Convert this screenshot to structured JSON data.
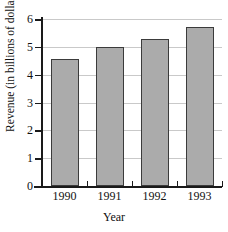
{
  "chart_data": {
    "type": "bar",
    "title": "",
    "categories": [
      "1990",
      "1991",
      "1992",
      "1993"
    ],
    "values": [
      4.55,
      5.0,
      5.27,
      5.72
    ],
    "xlabel": "Year",
    "ylabel": "Revenue (in billions of dollars)",
    "ylim": [
      0,
      6
    ],
    "ytick_labels": [
      "0",
      "1",
      "2",
      "3",
      "4",
      "5",
      "6"
    ],
    "ytick_values": [
      0,
      1,
      2,
      3,
      4,
      5,
      6
    ],
    "grid": true,
    "legend": false,
    "bar_color": "#ababab",
    "bar_edge_color": "#3b3b3b",
    "gridline_color": "#c9c9c9",
    "axis_color": "#1a1a1a"
  }
}
